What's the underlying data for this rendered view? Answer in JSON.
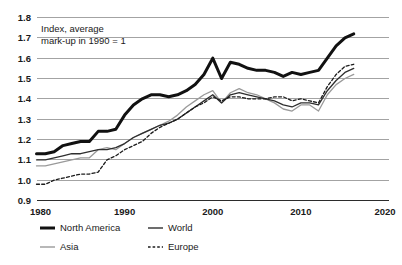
{
  "chart_data": {
    "type": "line",
    "title": "",
    "annotation_lines": [
      "Index, average",
      "mark-up in 1990 = 1"
    ],
    "xlabel": "",
    "ylabel": "",
    "xlim": [
      1980,
      2020
    ],
    "ylim": [
      0.9,
      1.8
    ],
    "xticks": [
      1980,
      1990,
      2000,
      2010,
      2020
    ],
    "xtick_labels": [
      "1980",
      "1990",
      "2000",
      "2010",
      "2020"
    ],
    "yticks": [
      0.9,
      1.0,
      1.1,
      1.2,
      1.3,
      1.4,
      1.5,
      1.6,
      1.7,
      1.8
    ],
    "ytick_labels": [
      "0.9",
      "1.0",
      "1.1",
      "1.2",
      "1.3",
      "1.4",
      "1.5",
      "1.6",
      "1.7",
      "1.8"
    ],
    "grid": true,
    "legend_position": "below-axis",
    "x": [
      1980,
      1981,
      1982,
      1983,
      1984,
      1985,
      1986,
      1987,
      1988,
      1989,
      1990,
      1991,
      1992,
      1993,
      1994,
      1995,
      1996,
      1997,
      1998,
      1999,
      2000,
      2001,
      2002,
      2003,
      2004,
      2005,
      2006,
      2007,
      2008,
      2009,
      2010,
      2011,
      2012,
      2013,
      2014,
      2015,
      2016
    ],
    "series": [
      {
        "name": "North America",
        "color": "#111111",
        "style": "solid-thick",
        "values": [
          1.13,
          1.13,
          1.14,
          1.17,
          1.18,
          1.19,
          1.19,
          1.24,
          1.24,
          1.25,
          1.32,
          1.37,
          1.4,
          1.42,
          1.42,
          1.41,
          1.42,
          1.44,
          1.47,
          1.52,
          1.6,
          1.5,
          1.58,
          1.57,
          1.55,
          1.54,
          1.54,
          1.53,
          1.51,
          1.53,
          1.52,
          1.53,
          1.54,
          1.6,
          1.66,
          1.7,
          1.72
        ]
      },
      {
        "name": "World",
        "color": "#2e2e2e",
        "style": "solid-thin",
        "values": [
          1.1,
          1.1,
          1.11,
          1.12,
          1.13,
          1.13,
          1.14,
          1.15,
          1.15,
          1.16,
          1.18,
          1.21,
          1.23,
          1.25,
          1.27,
          1.28,
          1.3,
          1.33,
          1.36,
          1.39,
          1.42,
          1.38,
          1.42,
          1.43,
          1.42,
          1.41,
          1.4,
          1.39,
          1.37,
          1.36,
          1.38,
          1.38,
          1.37,
          1.44,
          1.49,
          1.53,
          1.55
        ]
      },
      {
        "name": "Asia",
        "color": "#9a9a9a",
        "style": "solid-thin",
        "values": [
          1.07,
          1.07,
          1.08,
          1.09,
          1.1,
          1.11,
          1.11,
          1.15,
          1.16,
          1.15,
          1.18,
          1.21,
          1.23,
          1.25,
          1.27,
          1.29,
          1.32,
          1.36,
          1.39,
          1.42,
          1.44,
          1.38,
          1.43,
          1.45,
          1.43,
          1.42,
          1.4,
          1.38,
          1.35,
          1.34,
          1.37,
          1.37,
          1.34,
          1.42,
          1.47,
          1.5,
          1.52
        ]
      },
      {
        "name": "Europe",
        "color": "#1c1c1c",
        "style": "dashed",
        "values": [
          0.98,
          0.98,
          1.0,
          1.01,
          1.02,
          1.03,
          1.03,
          1.04,
          1.1,
          1.12,
          1.15,
          1.17,
          1.19,
          1.23,
          1.26,
          1.28,
          1.3,
          1.33,
          1.36,
          1.38,
          1.41,
          1.39,
          1.41,
          1.41,
          1.4,
          1.4,
          1.4,
          1.41,
          1.41,
          1.39,
          1.4,
          1.39,
          1.38,
          1.46,
          1.52,
          1.56,
          1.57
        ]
      }
    ]
  },
  "legend": {
    "items": [
      {
        "label": "North America",
        "key": "north-america"
      },
      {
        "label": "World",
        "key": "world"
      },
      {
        "label": "Asia",
        "key": "asia"
      },
      {
        "label": "Europe",
        "key": "europe"
      }
    ]
  }
}
